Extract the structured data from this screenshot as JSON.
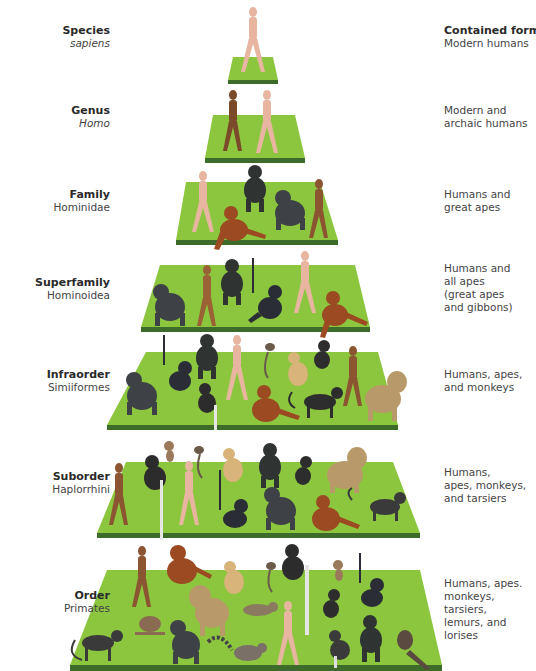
{
  "diagram": {
    "type": "taxonomic-pyramid",
    "right_header": "Contained forms:",
    "colors": {
      "platform_top": "#8cc63f",
      "platform_edge": "#3d6b2a",
      "rank_text": "#2a2a2a",
      "taxon_text": "#444444"
    },
    "levels": [
      {
        "rank": "Species",
        "taxon": "sapiens",
        "taxon_italic": true,
        "contained_forms": "Modern humans",
        "animals": [
          "modern human"
        ]
      },
      {
        "rank": "Genus",
        "taxon": "Homo",
        "taxon_italic": true,
        "contained_forms": "Modern and\narchaic humans",
        "animals": [
          "archaic human",
          "modern human"
        ]
      },
      {
        "rank": "Family",
        "taxon": "Hominidae",
        "taxon_italic": false,
        "contained_forms": "Humans and\ngreat apes",
        "animals": [
          "modern human",
          "chimpanzee",
          "gorilla",
          "orangutan",
          "archaic human"
        ]
      },
      {
        "rank": "Superfamily",
        "taxon": "Hominoidea",
        "taxon_italic": false,
        "contained_forms": "Humans and\nall apes\n(great apes\nand gibbons)",
        "animals": [
          "gorilla",
          "archaic human",
          "chimpanzee",
          "gibbon",
          "modern human",
          "orangutan"
        ]
      },
      {
        "rank": "Infraorder",
        "taxon": "Simiiformes",
        "taxon_italic": false,
        "contained_forms": "Humans, apes,\nand monkeys",
        "animals": [
          "gorilla",
          "gibbon",
          "chimpanzee",
          "colobus monkey",
          "modern human",
          "marmoset",
          "howler monkey",
          "orangutan",
          "spider monkey",
          "archaic human",
          "macaque",
          "baboon"
        ]
      },
      {
        "rank": "Suborder",
        "taxon": "Haplorrhini",
        "taxon_italic": false,
        "contained_forms": "Humans,\napes, monkeys,\nand tarsiers",
        "animals": [
          "archaic human",
          "tarsier",
          "colobus monkey",
          "marmoset",
          "modern human",
          "howler monkey",
          "gibbon",
          "chimpanzee",
          "gorilla",
          "spider monkey",
          "orangutan",
          "baboon",
          "macaque"
        ]
      },
      {
        "rank": "Order",
        "taxon": "Primates",
        "taxon_italic": false,
        "contained_forms": "Humans, apes.\nmonkeys, tarsiers,\nlemurs, and\nlorises",
        "animals": [
          "macaque",
          "archaic human",
          "orangutan",
          "loris",
          "baboon",
          "howler monkey",
          "gorilla",
          "ring-tailed lemur",
          "marmoset",
          "colobus monkey",
          "modern human",
          "tarsier",
          "spider monkey",
          "gibbon",
          "chimpanzee",
          "slow loris"
        ]
      }
    ]
  }
}
